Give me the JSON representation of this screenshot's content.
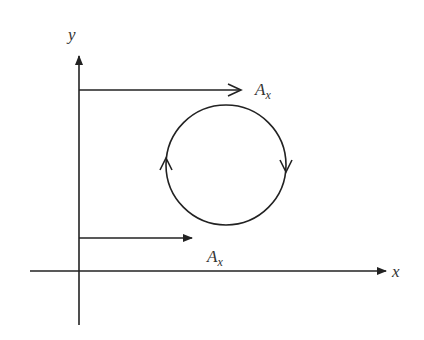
{
  "diagram": {
    "axes": {
      "x_label": "x",
      "y_label": "y"
    },
    "vectors": [
      {
        "label": "A",
        "subscript": "x",
        "position": "upper"
      },
      {
        "label": "A",
        "subscript": "x",
        "position": "lower"
      }
    ],
    "loop": {
      "shape": "circle",
      "direction": "clockwise"
    },
    "colors": {
      "stroke": "#222222",
      "background": "#ffffff"
    }
  }
}
